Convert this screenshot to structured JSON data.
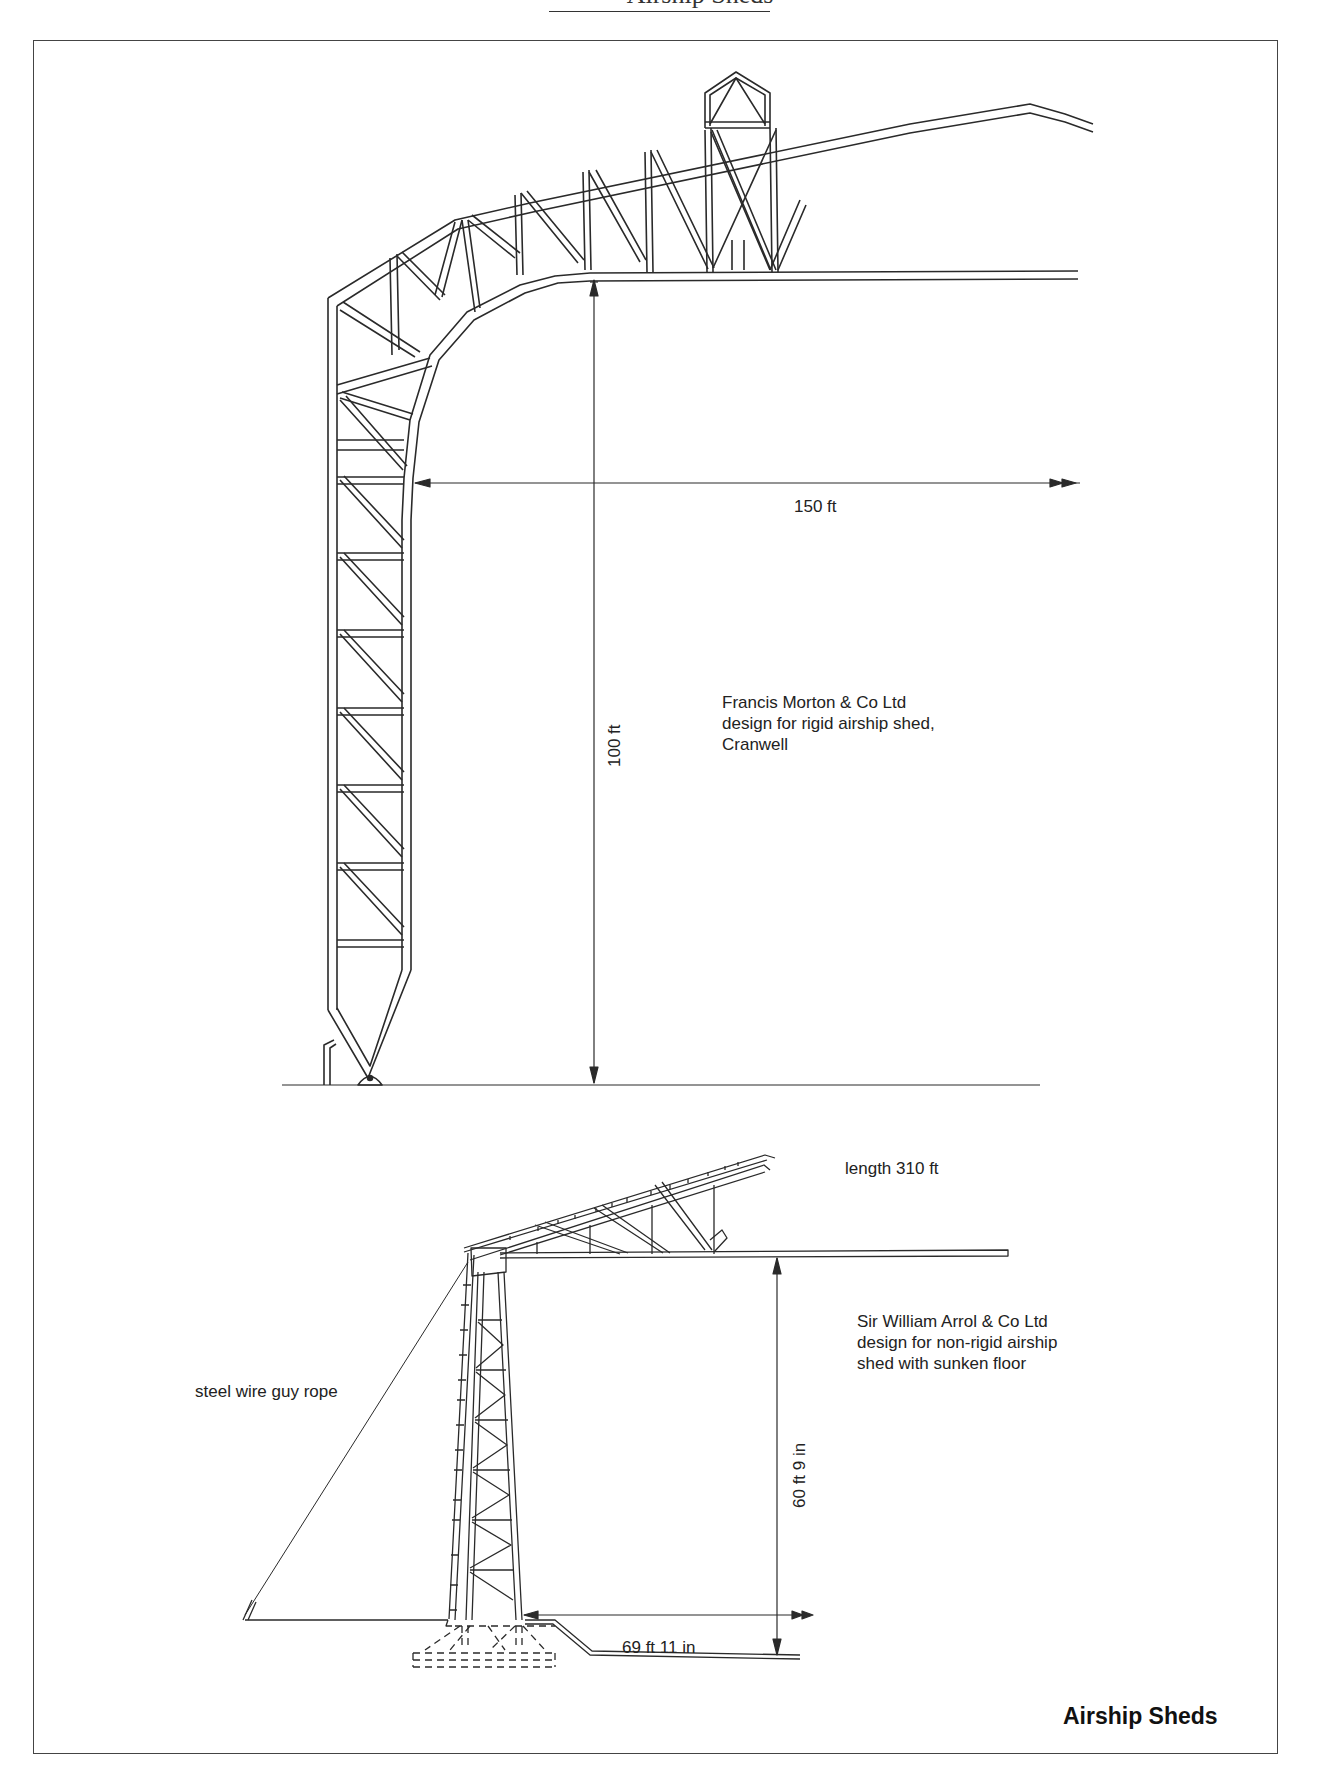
{
  "page": {
    "running_header": "Airship Sheds",
    "figure_title": "Airship Sheds"
  },
  "top_figure": {
    "caption_lines": [
      "Francis Morton & Co Ltd",
      "design for rigid airship shed,",
      "Cranwell"
    ],
    "dimensions": {
      "span": "150 ft",
      "height": "100 ft"
    }
  },
  "bottom_figure": {
    "caption_lines": [
      "Sir William Arrol & Co Ltd",
      "design for non-rigid airship",
      "shed with sunken floor"
    ],
    "length_note": "length 310 ft",
    "guy_rope_label": "steel wire guy rope",
    "dimensions": {
      "height": "60 ft 9 in",
      "span": "69 ft 11 in"
    }
  },
  "colors": {
    "line": "#2a2a2a",
    "frame": "#444444",
    "background": "#ffffff"
  }
}
